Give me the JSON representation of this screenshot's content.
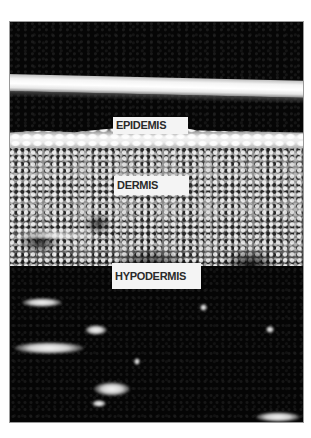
{
  "figure": {
    "type": "skin cross-section (grayscale imaging)",
    "labels": {
      "epidermis": "EPIDEMIS",
      "dermis": "DERMIS",
      "hypodermis": "HYPODERMIS"
    },
    "colors": {
      "background": "#ffffff",
      "image_dark": "#050505",
      "bright_band": "#f4f4f4",
      "dermis_gray": "#8a8a8a",
      "label_bg": "#f4f4f4",
      "label_text": "#2a2a2a"
    }
  }
}
